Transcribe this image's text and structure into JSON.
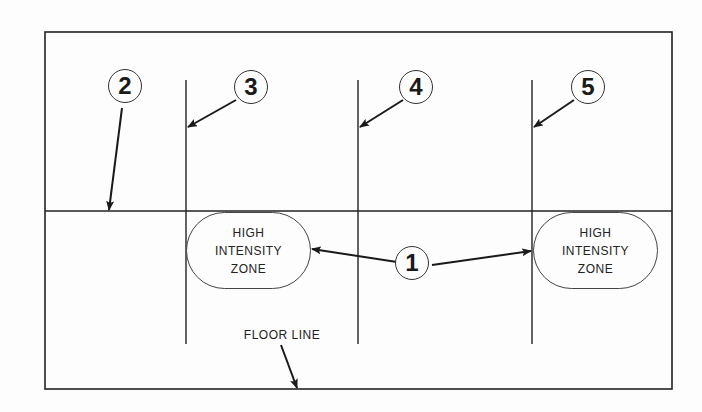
{
  "diagram": {
    "callouts": [
      {
        "id": "1",
        "label": "1"
      },
      {
        "id": "2",
        "label": "2"
      },
      {
        "id": "3",
        "label": "3"
      },
      {
        "id": "4",
        "label": "4"
      },
      {
        "id": "5",
        "label": "5"
      }
    ],
    "zones": [
      {
        "line1": "HIGH",
        "line2": "INTENSITY",
        "line3": "ZONE"
      },
      {
        "line1": "HIGH",
        "line2": "INTENSITY",
        "line3": "ZONE"
      }
    ],
    "floor_label": "FLOOR LINE",
    "colors": {
      "ink": "#222222",
      "background": "#fdfdfd"
    }
  }
}
